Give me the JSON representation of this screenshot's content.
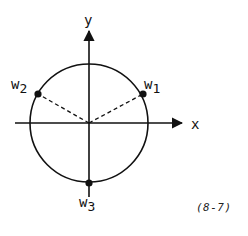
{
  "diagram": {
    "axes": {
      "x_label": "x",
      "y_label": "y"
    },
    "points": [
      {
        "name": "w1",
        "base": "w",
        "sub": "1"
      },
      {
        "name": "w2",
        "base": "w",
        "sub": "2"
      },
      {
        "name": "w3",
        "base": "w",
        "sub": "3"
      }
    ],
    "equation_number": "(8-7)",
    "colors": {
      "stroke": "#111111",
      "background": "#ffffff"
    }
  }
}
